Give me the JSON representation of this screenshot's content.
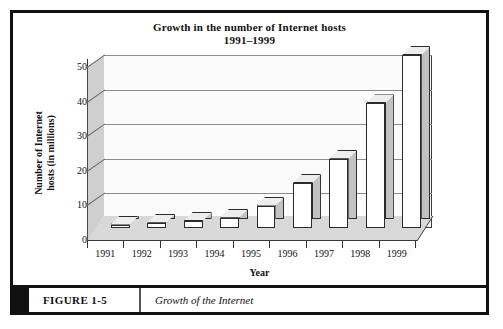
{
  "figure": {
    "number_label": "FIGURE 1-5",
    "caption": "Growth of the Internet"
  },
  "chart_data": {
    "type": "bar",
    "title": "Growth in the number of Internet hosts",
    "subtitle": "1991–1999",
    "xlabel": "Year",
    "ylabel_line1": "Number of Internet",
    "ylabel_line2": "hosts (in millions)",
    "categories": [
      "1991",
      "1992",
      "1993",
      "1994",
      "1995",
      "1996",
      "1997",
      "1998",
      "1999"
    ],
    "values": [
      1,
      1.5,
      2,
      3,
      6.5,
      13,
      20,
      36,
      50
    ],
    "ylim": [
      0,
      50
    ],
    "yticks": [
      0,
      10,
      20,
      30,
      40,
      50
    ],
    "ytick_labels": [
      "0",
      "10",
      "20",
      "30",
      "40",
      "50"
    ],
    "grid": true,
    "legend": "none",
    "style": "3d-column",
    "colors": {
      "bar_front": "#ffffff",
      "bar_side": "#c2c2c2",
      "bar_top": "#ededed",
      "bar_outline": "#2b2b2b",
      "back_wall": "#fbfbfb",
      "side_wall": "#cfcfcf",
      "floor": "#d8d8d8",
      "gridline": "#8c8c8c",
      "border": "#111111"
    }
  }
}
